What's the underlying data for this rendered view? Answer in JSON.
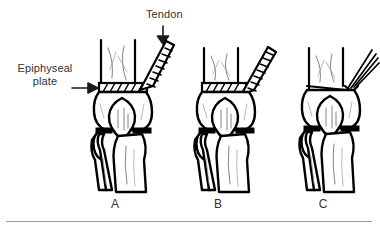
{
  "figure": {
    "type": "medical-line-illustration",
    "background_color": "#ffffff",
    "ink_color": "#000000",
    "text_color": "#333333"
  },
  "annotations": {
    "tendon": {
      "label": "Tendon",
      "arrow": "down-arrow",
      "points_to": "tendon attachment at medial epicondyle, panel A"
    },
    "epiphyseal_plate": {
      "label": "Epiphyseal\nplate",
      "arrow": "right-arrow",
      "points_to": "hatched growth-plate band, panel A"
    }
  },
  "panels": [
    {
      "letter": "A",
      "state": "intact epiphyseal plate with attached tendon",
      "tendon_style": "hatched-band"
    },
    {
      "letter": "B",
      "state": "plate beginning to avulse, tendon under traction",
      "tendon_style": "hatched-band"
    },
    {
      "letter": "C",
      "state": "tendon ruptured, frayed fibers retracted",
      "tendon_style": "frayed-fibers"
    }
  ],
  "rule": {
    "name": "bottom-divider",
    "color": "#9a9a9a"
  }
}
